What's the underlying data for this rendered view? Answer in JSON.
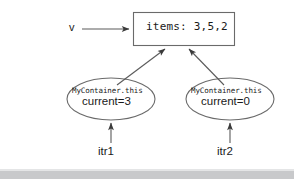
{
  "diagram": {
    "box": {
      "label": "items: 3,5,2"
    },
    "pointer_label": "v",
    "ellipses": [
      {
        "type_label": "MyContainer.this",
        "field_label": "current=3"
      },
      {
        "type_label": "MyContainer.this",
        "field_label": "current=0"
      }
    ],
    "iterator_labels": [
      "itr1",
      "itr2"
    ],
    "colors": {
      "stroke": "#555555",
      "text": "#1a1a1a",
      "background": "#ffffff",
      "band": "#c8c9cb"
    }
  }
}
